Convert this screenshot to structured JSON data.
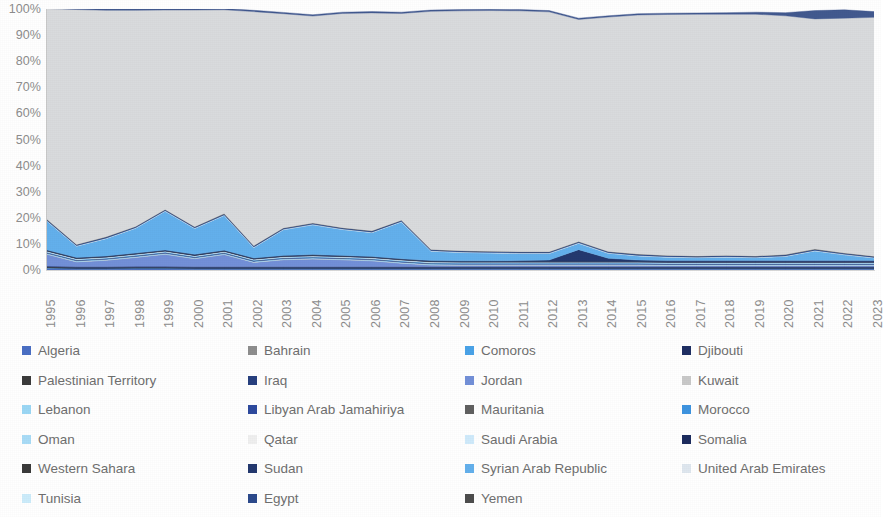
{
  "chart_data": {
    "type": "area",
    "stacked": true,
    "normalized": true,
    "title": "",
    "xlabel": "",
    "ylabel": "",
    "ylim": [
      0,
      100
    ],
    "ytick_labels": [
      "100%",
      "90%",
      "80%",
      "70%",
      "60%",
      "50%",
      "40%",
      "30%",
      "20%",
      "10%",
      "0%"
    ],
    "ytick_values": [
      100,
      90,
      80,
      70,
      60,
      50,
      40,
      30,
      20,
      10,
      0
    ],
    "grid": false,
    "legend_position": "bottom",
    "x": [
      1995,
      1996,
      1997,
      1998,
      1999,
      2000,
      2001,
      2002,
      2003,
      2004,
      2005,
      2006,
      2007,
      2008,
      2009,
      2010,
      2011,
      2012,
      2013,
      2014,
      2015,
      2016,
      2017,
      2018,
      2019,
      2020,
      2021,
      2022,
      2023
    ],
    "categories": [
      "1995",
      "1996",
      "1997",
      "1998",
      "1999",
      "2000",
      "2001",
      "2002",
      "2003",
      "2004",
      "2005",
      "2006",
      "2007",
      "2008",
      "2009",
      "2010",
      "2011",
      "2012",
      "2013",
      "2014",
      "2015",
      "2016",
      "2017",
      "2018",
      "2019",
      "2020",
      "2021",
      "2022",
      "2023"
    ],
    "series": [
      {
        "name": "Algeria",
        "color": "#4a6fc4",
        "values": [
          0.6,
          0.4,
          0.4,
          0.5,
          0.5,
          0.4,
          0.4,
          0.4,
          0.4,
          0.4,
          0.4,
          0.4,
          0.4,
          0.4,
          0.4,
          0.4,
          0.4,
          0.4,
          0.4,
          0.4,
          0.4,
          0.4,
          0.4,
          0.4,
          0.4,
          0.4,
          0.4,
          0.4,
          0.4
        ]
      },
      {
        "name": "Bahrain",
        "color": "#8e8e8e",
        "values": [
          0.1,
          0.1,
          0.1,
          0.1,
          0.1,
          0.1,
          0.1,
          0.1,
          0.1,
          0.1,
          0.1,
          0.1,
          0.1,
          0.1,
          0.1,
          0.1,
          0.1,
          0.1,
          0.1,
          0.1,
          0.1,
          0.1,
          0.1,
          0.1,
          0.1,
          0.1,
          0.1,
          0.1,
          0.1
        ]
      },
      {
        "name": "Comoros",
        "color": "#4aa3e8",
        "values": [
          0.1,
          0.1,
          0.1,
          0.1,
          0.1,
          0.1,
          0.1,
          0.1,
          0.1,
          0.1,
          0.1,
          0.1,
          0.1,
          0.1,
          0.1,
          0.1,
          0.1,
          0.1,
          0.1,
          0.1,
          0.1,
          0.1,
          0.1,
          0.1,
          0.1,
          0.1,
          0.1,
          0.1,
          0.1
        ]
      },
      {
        "name": "Djibouti",
        "color": "#1f2f63",
        "values": [
          0.2,
          0.2,
          0.2,
          0.2,
          0.2,
          0.2,
          0.2,
          0.2,
          0.2,
          0.2,
          0.2,
          0.2,
          0.2,
          0.2,
          0.2,
          0.2,
          0.2,
          0.2,
          0.2,
          0.2,
          0.2,
          0.2,
          0.2,
          0.2,
          0.2,
          0.2,
          0.2,
          0.2,
          0.2
        ]
      },
      {
        "name": "Palestinian Territory",
        "color": "#3b3b3b",
        "values": [
          0.2,
          0.2,
          0.2,
          0.2,
          0.2,
          0.2,
          0.2,
          0.2,
          0.2,
          0.2,
          0.2,
          0.2,
          0.2,
          0.2,
          0.2,
          0.2,
          0.2,
          0.2,
          0.2,
          0.2,
          0.2,
          0.2,
          0.2,
          0.2,
          0.2,
          0.2,
          0.2,
          0.2,
          0.2
        ]
      },
      {
        "name": "Iraq",
        "color": "#27407f",
        "values": [
          0.3,
          0.3,
          0.3,
          0.3,
          0.3,
          0.3,
          0.3,
          0.3,
          0.3,
          0.3,
          0.3,
          0.3,
          0.3,
          0.3,
          0.3,
          0.3,
          0.3,
          0.3,
          0.3,
          0.3,
          0.3,
          0.3,
          0.3,
          0.3,
          0.3,
          0.3,
          0.3,
          0.3,
          0.3
        ]
      },
      {
        "name": "Jordan",
        "color": "#7390d8",
        "values": [
          4.5,
          1.8,
          2.4,
          3.4,
          4.6,
          3.0,
          4.6,
          1.6,
          2.6,
          2.9,
          2.6,
          2.2,
          1.3,
          0.6,
          0.5,
          0.5,
          0.5,
          0.5,
          0.5,
          0.5,
          0.5,
          0.4,
          0.4,
          0.4,
          0.4,
          0.4,
          0.4,
          0.4,
          0.4
        ]
      },
      {
        "name": "Kuwait",
        "color": "#c9c9c9",
        "values": [
          0.1,
          0.1,
          0.1,
          0.1,
          0.1,
          0.1,
          0.1,
          0.1,
          0.1,
          0.1,
          0.1,
          0.1,
          0.1,
          0.1,
          0.1,
          0.1,
          0.1,
          0.1,
          0.1,
          0.1,
          0.1,
          0.1,
          0.1,
          0.1,
          0.1,
          0.1,
          0.1,
          0.1,
          0.1
        ]
      },
      {
        "name": "Lebanon",
        "color": "#9bd7f5",
        "values": [
          0.3,
          0.3,
          0.3,
          0.3,
          0.3,
          0.3,
          0.3,
          0.3,
          0.3,
          0.3,
          0.3,
          0.3,
          0.3,
          0.3,
          0.3,
          0.3,
          0.3,
          0.3,
          0.3,
          0.3,
          0.3,
          0.3,
          0.3,
          0.3,
          0.3,
          0.3,
          0.3,
          0.3,
          0.3
        ]
      },
      {
        "name": "Libyan Arab Jamahiriya",
        "color": "#2e4a9e",
        "values": [
          0.2,
          0.2,
          0.2,
          0.2,
          0.2,
          0.2,
          0.2,
          0.2,
          0.2,
          0.2,
          0.2,
          0.2,
          0.2,
          0.2,
          0.2,
          0.2,
          0.2,
          0.2,
          0.2,
          0.2,
          0.2,
          0.2,
          0.2,
          0.2,
          0.2,
          0.2,
          0.2,
          0.2,
          0.2
        ]
      },
      {
        "name": "Mauritania",
        "color": "#606060",
        "values": [
          0.1,
          0.1,
          0.1,
          0.1,
          0.1,
          0.1,
          0.1,
          0.1,
          0.1,
          0.1,
          0.1,
          0.1,
          0.1,
          0.1,
          0.1,
          0.1,
          0.1,
          0.1,
          0.1,
          0.1,
          0.1,
          0.1,
          0.1,
          0.1,
          0.1,
          0.1,
          0.1,
          0.1,
          0.1
        ]
      },
      {
        "name": "Morocco",
        "color": "#3e94e0",
        "values": [
          0.2,
          0.2,
          0.2,
          0.2,
          0.2,
          0.2,
          0.2,
          0.2,
          0.2,
          0.2,
          0.2,
          0.2,
          0.2,
          0.2,
          0.2,
          0.2,
          0.2,
          0.2,
          0.2,
          0.2,
          0.2,
          0.2,
          0.2,
          0.2,
          0.2,
          0.2,
          0.2,
          0.2,
          0.2
        ]
      },
      {
        "name": "Oman",
        "color": "#a9dcf7",
        "values": [
          0.1,
          0.1,
          0.1,
          0.1,
          0.1,
          0.1,
          0.1,
          0.1,
          0.1,
          0.1,
          0.1,
          0.1,
          0.1,
          0.1,
          0.1,
          0.1,
          0.1,
          0.1,
          0.1,
          0.1,
          0.1,
          0.1,
          0.1,
          0.1,
          0.1,
          0.1,
          0.1,
          0.1,
          0.1
        ]
      },
      {
        "name": "Qatar",
        "color": "#efefef",
        "values": [
          0.1,
          0.1,
          0.1,
          0.1,
          0.1,
          0.1,
          0.1,
          0.1,
          0.1,
          0.1,
          0.1,
          0.1,
          0.1,
          0.1,
          0.1,
          0.1,
          0.1,
          0.1,
          0.1,
          0.1,
          0.1,
          0.1,
          0.1,
          0.1,
          0.1,
          0.1,
          0.1,
          0.1,
          0.1
        ]
      },
      {
        "name": "Saudi Arabia",
        "color": "#cfeafb",
        "values": [
          0.1,
          0.1,
          0.1,
          0.1,
          0.1,
          0.1,
          0.1,
          0.1,
          0.1,
          0.1,
          0.1,
          0.1,
          0.1,
          0.1,
          0.1,
          0.1,
          0.1,
          0.1,
          0.1,
          0.1,
          0.1,
          0.1,
          0.1,
          0.1,
          0.1,
          0.1,
          0.1,
          0.1,
          0.1
        ]
      },
      {
        "name": "Somalia",
        "color": "#1d2c5e",
        "values": [
          0.2,
          0.2,
          0.2,
          0.2,
          0.2,
          0.2,
          0.2,
          0.2,
          0.2,
          0.2,
          0.2,
          0.2,
          0.2,
          0.2,
          0.2,
          0.2,
          0.2,
          0.2,
          0.2,
          0.2,
          0.2,
          0.2,
          0.2,
          0.2,
          0.2,
          0.2,
          0.2,
          0.2,
          0.2
        ]
      },
      {
        "name": "Western Sahara",
        "color": "#3a3a3a",
        "values": [
          0.1,
          0.1,
          0.1,
          0.1,
          0.1,
          0.1,
          0.1,
          0.1,
          0.1,
          0.1,
          0.1,
          0.1,
          0.1,
          0.1,
          0.1,
          0.1,
          0.1,
          0.1,
          0.1,
          0.1,
          0.1,
          0.1,
          0.1,
          0.1,
          0.1,
          0.1,
          0.1,
          0.1,
          0.1
        ]
      },
      {
        "name": "Sudan",
        "color": "#24396f",
        "values": [
          0.2,
          0.2,
          0.2,
          0.2,
          0.2,
          0.2,
          0.2,
          0.2,
          0.2,
          0.2,
          0.2,
          0.2,
          0.2,
          0.2,
          0.2,
          0.2,
          0.3,
          0.5,
          4.5,
          1.2,
          0.5,
          0.4,
          0.4,
          0.4,
          0.4,
          0.4,
          0.4,
          0.4,
          0.4
        ]
      },
      {
        "name": "Syrian Arab Republic",
        "color": "#63b0ec",
        "values": [
          11.0,
          4.3,
          6.6,
          9.5,
          14.8,
          9.9,
          13.3,
          4.0,
          9.8,
          11.4,
          9.9,
          9.1,
          14.1,
          3.6,
          3.2,
          3.0,
          2.7,
          2.5,
          2.4,
          1.9,
          1.6,
          1.3,
          1.1,
          1.3,
          1.1,
          1.6,
          3.7,
          2.2,
          1.0
        ]
      },
      {
        "name": "United Arab Emirates",
        "color": "#dfe7ef",
        "values": [
          0.1,
          0.1,
          0.1,
          0.1,
          0.1,
          0.1,
          0.1,
          0.1,
          0.1,
          0.1,
          0.1,
          0.1,
          0.1,
          0.1,
          0.1,
          0.1,
          0.1,
          0.1,
          0.1,
          0.1,
          0.1,
          0.1,
          0.1,
          0.1,
          0.1,
          0.1,
          0.1,
          0.1,
          0.1
        ]
      },
      {
        "name": "Tunisia",
        "color": "#ccecfb",
        "values": [
          0.1,
          0.1,
          0.1,
          0.1,
          0.1,
          0.1,
          0.1,
          0.1,
          0.1,
          0.1,
          0.1,
          0.1,
          0.1,
          0.1,
          0.1,
          0.1,
          0.1,
          0.1,
          0.1,
          0.1,
          0.1,
          0.1,
          0.1,
          0.1,
          0.1,
          0.1,
          0.1,
          0.1,
          0.1
        ]
      },
      {
        "name": "Egypt",
        "color": "#2c4a8c",
        "values": [
          0.4,
          0.4,
          0.4,
          0.4,
          0.4,
          0.4,
          0.4,
          0.4,
          0.4,
          0.4,
          0.4,
          0.4,
          0.4,
          0.4,
          0.4,
          0.4,
          0.4,
          0.4,
          0.4,
          0.4,
          0.4,
          0.4,
          0.4,
          0.4,
          0.4,
          0.4,
          0.4,
          0.4,
          0.4
        ]
      },
      {
        "name": "Yemen",
        "color": "#4d4d4d",
        "values": [
          0.1,
          0.1,
          0.1,
          0.1,
          0.1,
          0.1,
          0.1,
          0.1,
          0.1,
          0.1,
          0.1,
          0.1,
          0.1,
          0.1,
          0.1,
          0.1,
          0.1,
          0.1,
          0.1,
          0.1,
          0.1,
          0.1,
          0.1,
          0.1,
          0.1,
          0.1,
          0.1,
          0.1,
          0.1
        ]
      },
      {
        "name": "Other",
        "color": "#d9dbdd",
        "values": [
          80.8,
          90.0,
          86.8,
          82.8,
          76.4,
          83.0,
          78.1,
          89.7,
          82.1,
          79.3,
          82.1,
          83.5,
          79.2,
          91.2,
          91.9,
          92.2,
          92.3,
          91.9,
          85.1,
          89.8,
          91.6,
          92.3,
          92.6,
          92.4,
          92.6,
          91.5,
          88.2,
          90.0,
          91.5
        ]
      },
      {
        "name": "Top band",
        "color": "#42598f",
        "values": [
          0.9,
          0.9,
          0.5,
          0.5,
          0.5,
          0.5,
          0.5,
          0.5,
          0.5,
          0.5,
          0.5,
          0.5,
          0.5,
          0.5,
          0.5,
          0.5,
          0.5,
          0.5,
          0.5,
          0.5,
          0.5,
          0.5,
          0.5,
          0.6,
          0.8,
          1.2,
          3.2,
          3.2,
          2.2
        ]
      }
    ]
  },
  "legend": {
    "rows": [
      [
        {
          "label": "Algeria",
          "color": "#4a6fc4"
        },
        {
          "label": "Bahrain",
          "color": "#8e8e8e"
        },
        {
          "label": "Comoros",
          "color": "#4aa3e8"
        },
        {
          "label": "Djibouti",
          "color": "#1f2f63"
        }
      ],
      [
        {
          "label": "Palestinian Territory",
          "color": "#3b3b3b"
        },
        {
          "label": "Iraq",
          "color": "#27407f"
        },
        {
          "label": "Jordan",
          "color": "#7390d8"
        },
        {
          "label": "Kuwait",
          "color": "#c9c9c9"
        }
      ],
      [
        {
          "label": "Lebanon",
          "color": "#9bd7f5"
        },
        {
          "label": "Libyan Arab Jamahiriya",
          "color": "#2e4a9e"
        },
        {
          "label": "Mauritania",
          "color": "#606060"
        },
        {
          "label": "Morocco",
          "color": "#3e94e0"
        }
      ],
      [
        {
          "label": "Oman",
          "color": "#a9dcf7"
        },
        {
          "label": "Qatar",
          "color": "#efefef"
        },
        {
          "label": "Saudi Arabia",
          "color": "#cfeafb"
        },
        {
          "label": "Somalia",
          "color": "#1d2c5e"
        }
      ],
      [
        {
          "label": "Western Sahara",
          "color": "#3a3a3a"
        },
        {
          "label": "Sudan",
          "color": "#24396f"
        },
        {
          "label": "Syrian Arab Republic",
          "color": "#63b0ec"
        },
        {
          "label": "United Arab Emirates",
          "color": "#dfe7ef"
        }
      ],
      [
        {
          "label": "Tunisia",
          "color": "#ccecfb"
        },
        {
          "label": "Egypt",
          "color": "#2c4a8c"
        },
        {
          "label": "Yemen",
          "color": "#4d4d4d"
        }
      ]
    ],
    "column_x": [
      22,
      248,
      465,
      682
    ]
  }
}
